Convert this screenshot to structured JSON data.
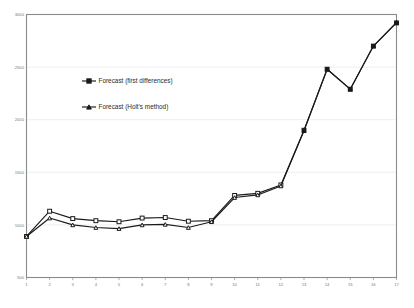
{
  "chart_data": {
    "type": "line",
    "title": "",
    "subtitle": "",
    "xlabel": "",
    "ylabel": "",
    "x": [
      1,
      2,
      3,
      4,
      5,
      6,
      7,
      8,
      9,
      10,
      11,
      12,
      13,
      14,
      15,
      16,
      17
    ],
    "xtick_labels": [
      "1",
      "2",
      "3",
      "4",
      "5",
      "6",
      "7",
      "8",
      "9",
      "10",
      "11",
      "12",
      "13",
      "14",
      "15",
      "16",
      "17"
    ],
    "ytick_labels": [
      "500",
      "1000",
      "1500",
      "2000",
      "2500",
      "3000"
    ],
    "ytick_values": [
      500,
      1000,
      1500,
      2000,
      2500,
      3000
    ],
    "ylim": [
      500,
      3000
    ],
    "xlim": [
      1,
      17
    ],
    "grid": true,
    "grid_axis": "y",
    "legend_position": "center-left-inside",
    "series": [
      {
        "name": "Forecast (first differences)",
        "marker": "square",
        "color": "#1a1a1a",
        "values": [
          890,
          1130,
          1060,
          1040,
          1030,
          1065,
          1070,
          1035,
          1040,
          1280,
          1300,
          1380,
          1900,
          2480,
          2290,
          2700,
          2920
        ]
      },
      {
        "name": "Forecast (Holt's method)",
        "marker": "triangle",
        "color": "#1a1a1a",
        "values": [
          890,
          1065,
          1000,
          975,
          965,
          1000,
          1005,
          975,
          1030,
          1260,
          1285,
          1370,
          1895,
          2480,
          2290,
          2700,
          2925
        ]
      }
    ]
  },
  "legend": {
    "items": [
      {
        "label": "Forecast (first differences)",
        "marker": "square"
      },
      {
        "label": "Forecast (Holt's method)",
        "marker": "triangle"
      }
    ]
  },
  "colors": {
    "line": "#1a1a1a",
    "marker_fill": "#ffffff",
    "marker_stroke": "#1a1a1a",
    "grid": "#e8e8e8",
    "axis": "#8a8a8a",
    "tick_text": "#7a7a7a",
    "legend_text": "#2b2b2b",
    "background": "#ffffff"
  }
}
